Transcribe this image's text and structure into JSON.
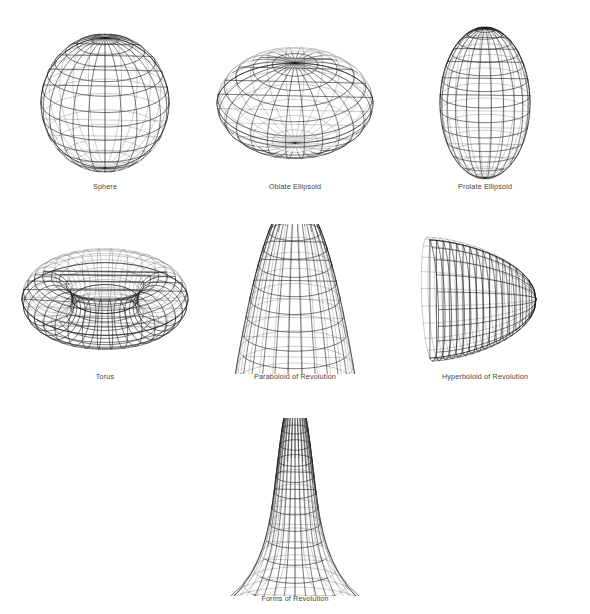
{
  "plate": {
    "background": "#ffffff",
    "ink": "#1b1b1b",
    "caption_color": "#3f3f3f",
    "header_faint_text": "· · ·"
  },
  "figures": [
    {
      "id": "sphere",
      "caption": "Sphere",
      "row": 1,
      "col": 1,
      "box": {
        "x": 14,
        "y": 14,
        "w": 182,
        "h": 178
      },
      "caption_y": 182,
      "shape": {
        "kind": "revolution",
        "profile": "circle",
        "params": {
          "rx": 64,
          "ry": 70
        },
        "meridians": 24,
        "parallels": 14,
        "view_tilt_deg": 22
      }
    },
    {
      "id": "oblate-ellipsoid",
      "caption": "Oblate Ellipsoid",
      "row": 1,
      "col": 2,
      "box": {
        "x": 204,
        "y": 14,
        "w": 182,
        "h": 178
      },
      "caption_y": 182,
      "shape": {
        "kind": "revolution",
        "profile": "ellipse",
        "params": {
          "rx": 78,
          "ry": 46
        },
        "meridians": 26,
        "parallels": 11,
        "view_tilt_deg": 30
      }
    },
    {
      "id": "prolate-ellipsoid",
      "caption": "Prolate Ellipsoid",
      "row": 1,
      "col": 3,
      "box": {
        "x": 394,
        "y": 14,
        "w": 182,
        "h": 178
      },
      "caption_y": 182,
      "shape": {
        "kind": "revolution",
        "profile": "ellipse",
        "params": {
          "rx": 45,
          "ry": 78
        },
        "meridians": 22,
        "parallels": 15,
        "view_tilt_deg": 16
      }
    },
    {
      "id": "torus",
      "caption": "Torus",
      "row": 2,
      "col": 1,
      "box": {
        "x": 14,
        "y": 224,
        "w": 182,
        "h": 150
      },
      "caption_y": 372,
      "shape": {
        "kind": "torus",
        "params": {
          "R": 58,
          "r": 25
        },
        "meridians": 34,
        "parallels": 18,
        "view_tilt_deg": 26
      }
    },
    {
      "id": "paraboloid-of-revolution",
      "caption": "Paraboloid of Revolution",
      "row": 2,
      "col": 2,
      "box": {
        "x": 204,
        "y": 224,
        "w": 182,
        "h": 150
      },
      "caption_y": 372,
      "shape": {
        "kind": "revolution",
        "profile": "paraboloid",
        "params": {
          "rx": 64,
          "ry": 108
        },
        "meridians": 26,
        "parallels": 12,
        "view_tilt_deg": 20
      }
    },
    {
      "id": "hyperboloid-of-revolution",
      "caption": "Hyperboloid of Revolution",
      "row": 2,
      "col": 3,
      "box": {
        "x": 394,
        "y": 224,
        "w": 182,
        "h": 150
      },
      "caption_y": 372,
      "shape": {
        "kind": "hyperboloid-sideways",
        "params": {
          "len": 106,
          "rmax": 62
        },
        "meridians": 22,
        "parallels": 16,
        "view_tilt_deg": 18
      }
    },
    {
      "id": "forms-of-revolution",
      "caption": "Forms of Revolution",
      "row": 3,
      "col": 2,
      "box": {
        "x": 195,
        "y": 418,
        "w": 200,
        "h": 178
      },
      "caption_y": 594,
      "shape": {
        "kind": "revolution",
        "profile": "bell",
        "params": {
          "rx": 86,
          "ry": 132
        },
        "meridians": 28,
        "parallels": 16,
        "view_tilt_deg": 20
      }
    }
  ]
}
